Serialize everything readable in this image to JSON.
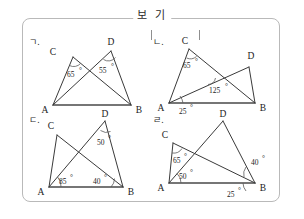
{
  "header": {
    "label": "보 기"
  },
  "figures": [
    {
      "tag": "ㄱ.",
      "vertices": [
        {
          "name": "A",
          "x": 26,
          "y": 70
        },
        {
          "name": "B",
          "x": 104,
          "y": 70
        },
        {
          "name": "C",
          "x": 46,
          "y": 22
        },
        {
          "name": "D",
          "x": 84,
          "y": 16
        }
      ],
      "angles": [
        {
          "value": "65",
          "unit": "°",
          "at": "C"
        },
        {
          "value": "55",
          "unit": "°",
          "at": "D"
        }
      ]
    },
    {
      "tag": "ㄴ.",
      "vertices": [
        {
          "name": "A",
          "x": 18,
          "y": 68
        },
        {
          "name": "B",
          "x": 104,
          "y": 68
        },
        {
          "name": "C",
          "x": 38,
          "y": 14
        },
        {
          "name": "D",
          "x": 98,
          "y": 32
        }
      ],
      "angles": [
        {
          "value": "65",
          "unit": "°",
          "at": "C"
        },
        {
          "value": "125",
          "unit": "°",
          "at": "intersection"
        },
        {
          "value": "25",
          "unit": "°",
          "at": "A-below"
        }
      ]
    },
    {
      "tag": "ㄷ.",
      "vertices": [
        {
          "name": "A",
          "x": 22,
          "y": 74
        },
        {
          "name": "B",
          "x": 96,
          "y": 74
        },
        {
          "name": "C",
          "x": 30,
          "y": 22
        },
        {
          "name": "D",
          "x": 78,
          "y": 8
        }
      ],
      "angles": [
        {
          "value": "50",
          "unit": "°",
          "at": "D"
        },
        {
          "value": "85",
          "unit": "°",
          "at": "A"
        },
        {
          "value": "40",
          "unit": "°",
          "at": "B"
        }
      ]
    },
    {
      "tag": "ㄹ.",
      "vertices": [
        {
          "name": "A",
          "x": 18,
          "y": 70
        },
        {
          "name": "B",
          "x": 104,
          "y": 70
        },
        {
          "name": "C",
          "x": 22,
          "y": 30
        },
        {
          "name": "D",
          "x": 72,
          "y": 8
        }
      ],
      "angles": [
        {
          "value": "65",
          "unit": "°",
          "at": "C"
        },
        {
          "value": "50",
          "unit": "°",
          "at": "A"
        },
        {
          "value": "40",
          "unit": "°",
          "at": "B-upper"
        },
        {
          "value": "25",
          "unit": "°",
          "at": "B-below"
        }
      ]
    }
  ]
}
